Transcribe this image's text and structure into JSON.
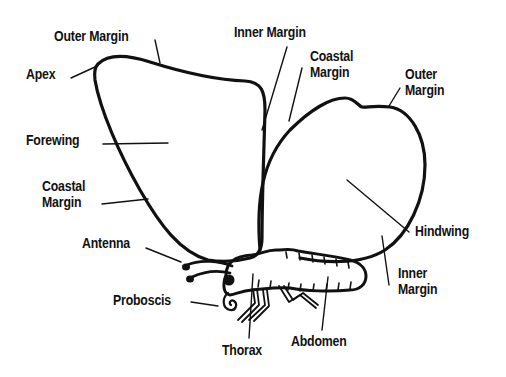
{
  "colors": {
    "ink": "#111111",
    "background": "#ffffff"
  },
  "labels": {
    "outer_margin_fore": "Outer Margin",
    "apex": "Apex",
    "forewing": "Forewing",
    "coastal_margin_fore": [
      "Coastal",
      "Margin"
    ],
    "antenna": "Antenna",
    "proboscis": "Proboscis",
    "thorax": "Thorax",
    "abdomen": "Abdomen",
    "inner_margin_fore": "Inner Margin",
    "coastal_margin_hind": [
      "Coastal",
      "Margin"
    ],
    "outer_margin_hind": [
      "Outer",
      "Margin"
    ],
    "hindwing": "Hindwing",
    "inner_margin_hind": [
      "Inner",
      "Margin"
    ]
  }
}
